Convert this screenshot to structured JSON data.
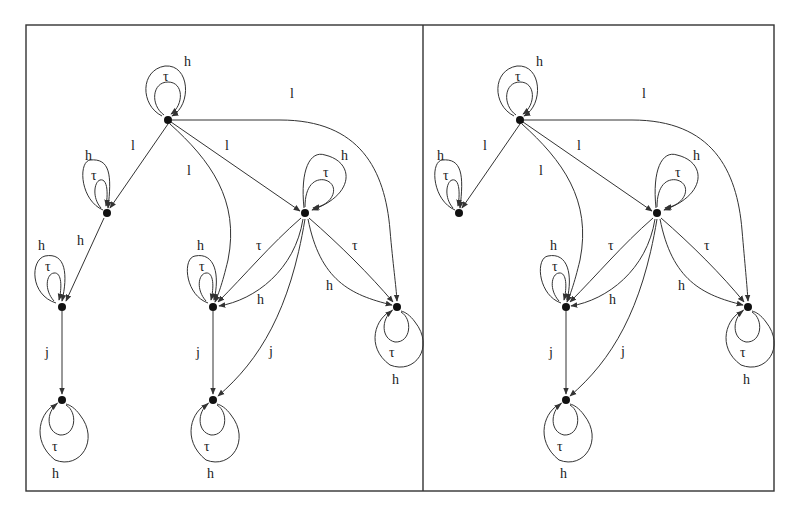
{
  "figure": {
    "frame": {
      "x": 26,
      "y": 25,
      "width": 748,
      "height": 466,
      "divider_x": 423
    },
    "panels": [
      {
        "id": "left",
        "nodes": [
          {
            "id": "A",
            "x": 168,
            "y": 120
          },
          {
            "id": "B",
            "x": 107,
            "y": 213
          },
          {
            "id": "C",
            "x": 62,
            "y": 307
          },
          {
            "id": "D",
            "x": 62,
            "y": 400
          },
          {
            "id": "E",
            "x": 213,
            "y": 307
          },
          {
            "id": "F",
            "x": 213,
            "y": 400
          },
          {
            "id": "G",
            "x": 305,
            "y": 213
          },
          {
            "id": "H",
            "x": 397,
            "y": 307
          }
        ],
        "edges": [
          {
            "from": "A",
            "to": "A",
            "label": "τ",
            "kind": "self-inner"
          },
          {
            "from": "A",
            "to": "A",
            "label": "h",
            "kind": "self-outer"
          },
          {
            "from": "A",
            "to": "B",
            "label": "l"
          },
          {
            "from": "A",
            "to": "E",
            "label": "l"
          },
          {
            "from": "A",
            "to": "G",
            "label": "l"
          },
          {
            "from": "A",
            "to": "H",
            "label": "l"
          },
          {
            "from": "B",
            "to": "B",
            "label": "τ",
            "kind": "self-inner"
          },
          {
            "from": "B",
            "to": "B",
            "label": "h",
            "kind": "self-outer"
          },
          {
            "from": "B",
            "to": "C",
            "label": "h"
          },
          {
            "from": "C",
            "to": "C",
            "label": "τ",
            "kind": "self-inner"
          },
          {
            "from": "C",
            "to": "C",
            "label": "h",
            "kind": "self-outer"
          },
          {
            "from": "C",
            "to": "D",
            "label": "j"
          },
          {
            "from": "D",
            "to": "D",
            "label": "τ",
            "kind": "self-inner"
          },
          {
            "from": "D",
            "to": "D",
            "label": "h",
            "kind": "self-outer"
          },
          {
            "from": "G",
            "to": "G",
            "label": "τ",
            "kind": "self-inner"
          },
          {
            "from": "G",
            "to": "G",
            "label": "h",
            "kind": "self-outer"
          },
          {
            "from": "G",
            "to": "E",
            "label": "τ"
          },
          {
            "from": "G",
            "to": "E",
            "label": "h"
          },
          {
            "from": "G",
            "to": "F",
            "label": "j"
          },
          {
            "from": "G",
            "to": "H",
            "label": "τ"
          },
          {
            "from": "G",
            "to": "H",
            "label": "h"
          },
          {
            "from": "E",
            "to": "E",
            "label": "τ",
            "kind": "self-inner"
          },
          {
            "from": "E",
            "to": "E",
            "label": "h",
            "kind": "self-outer"
          },
          {
            "from": "E",
            "to": "F",
            "label": "j"
          },
          {
            "from": "F",
            "to": "F",
            "label": "τ",
            "kind": "self-inner"
          },
          {
            "from": "F",
            "to": "F",
            "label": "h",
            "kind": "self-outer"
          },
          {
            "from": "H",
            "to": "H",
            "label": "τ",
            "kind": "self-inner"
          },
          {
            "from": "H",
            "to": "H",
            "label": "h",
            "kind": "self-outer"
          }
        ]
      },
      {
        "id": "right",
        "nodes": [
          {
            "id": "A",
            "x": 520,
            "y": 120
          },
          {
            "id": "B",
            "x": 459,
            "y": 213
          },
          {
            "id": "E",
            "x": 566,
            "y": 307
          },
          {
            "id": "F",
            "x": 566,
            "y": 400
          },
          {
            "id": "G",
            "x": 657,
            "y": 213
          },
          {
            "id": "H",
            "x": 748,
            "y": 307
          }
        ],
        "edges": [
          {
            "from": "A",
            "to": "A",
            "label": "τ",
            "kind": "self-inner"
          },
          {
            "from": "A",
            "to": "A",
            "label": "h",
            "kind": "self-outer"
          },
          {
            "from": "A",
            "to": "B",
            "label": "l"
          },
          {
            "from": "A",
            "to": "E",
            "label": "l"
          },
          {
            "from": "A",
            "to": "G",
            "label": "l"
          },
          {
            "from": "A",
            "to": "H",
            "label": "l"
          },
          {
            "from": "B",
            "to": "B",
            "label": "τ",
            "kind": "self-inner"
          },
          {
            "from": "B",
            "to": "B",
            "label": "h",
            "kind": "self-outer"
          },
          {
            "from": "G",
            "to": "G",
            "label": "τ",
            "kind": "self-inner"
          },
          {
            "from": "G",
            "to": "G",
            "label": "h",
            "kind": "self-outer"
          },
          {
            "from": "G",
            "to": "E",
            "label": "τ"
          },
          {
            "from": "G",
            "to": "E",
            "label": "h"
          },
          {
            "from": "G",
            "to": "F",
            "label": "j"
          },
          {
            "from": "G",
            "to": "H",
            "label": "τ"
          },
          {
            "from": "G",
            "to": "H",
            "label": "h"
          },
          {
            "from": "E",
            "to": "E",
            "label": "τ",
            "kind": "self-inner"
          },
          {
            "from": "E",
            "to": "E",
            "label": "h",
            "kind": "self-outer"
          },
          {
            "from": "E",
            "to": "F",
            "label": "j"
          },
          {
            "from": "F",
            "to": "F",
            "label": "τ",
            "kind": "self-inner"
          },
          {
            "from": "F",
            "to": "F",
            "label": "h",
            "kind": "self-outer"
          },
          {
            "from": "H",
            "to": "H",
            "label": "τ",
            "kind": "self-inner"
          },
          {
            "from": "H",
            "to": "H",
            "label": "h",
            "kind": "self-outer"
          }
        ]
      }
    ],
    "labels": {
      "tau": "τ",
      "h": "h",
      "l": "l",
      "j": "j"
    }
  }
}
